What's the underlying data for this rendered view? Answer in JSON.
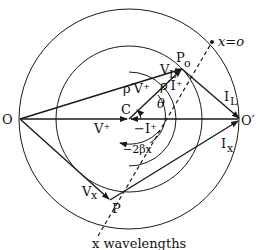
{
  "diagram": {
    "type": "transmission-line-circle-diagram",
    "points": {
      "O": "O",
      "O_prime": "O′",
      "C": "C",
      "P0": "P",
      "P0_sub": "o",
      "P": "P"
    },
    "labels": {
      "x_eq_o": "x=o",
      "x_wavelengths": "x wavelengths",
      "VL": "V",
      "VL_sub": "L",
      "IL": "I",
      "IL_sub": "L",
      "Vx": "V",
      "Vx_sub": "x",
      "Ix": "I",
      "Ix_sub": "x",
      "V_plus": "V⁺",
      "minus_I_plus": "−I⁺",
      "rho_V_plus": "ρ′V⁺",
      "rho_I_plus": "ρ′I⁺",
      "theta": "θ",
      "minus_2_beta_x": "−2βx"
    },
    "colors": {
      "ink": "#1a1a1a",
      "background": "#ffffff"
    }
  }
}
